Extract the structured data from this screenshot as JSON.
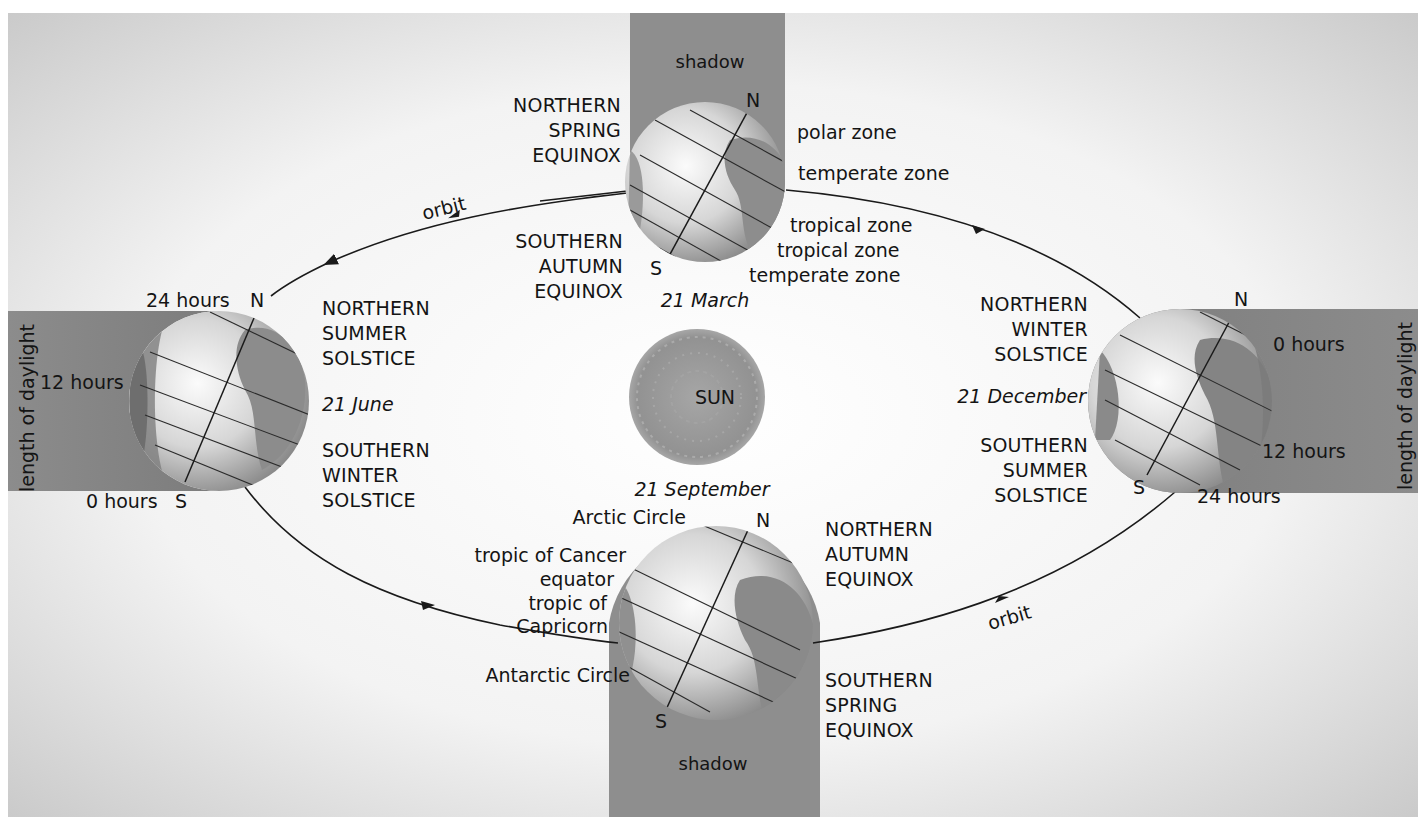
{
  "diagram": {
    "colors": {
      "background_light": "#f4f4f4",
      "background_dark": "#b8b8b8",
      "shadow_band": "#8f8f8f",
      "sun": "#9a9a9a",
      "globe_light": "#f2f2f2",
      "globe_dark": "#7a7a7a",
      "line": "#1a1a1a"
    },
    "sun": {
      "label": "SUN"
    },
    "orbit_labels": [
      "orbit",
      "orbit"
    ],
    "dates": {
      "march": "21 March",
      "june": "21 June",
      "september": "21 September",
      "december": "21 December"
    },
    "seasons": {
      "top_north": [
        "NORTHERN",
        "SPRING",
        "EQUINOX"
      ],
      "top_south": [
        "SOUTHERN",
        "AUTUMN",
        "EQUINOX"
      ],
      "left_north": [
        "NORTHERN",
        "SUMMER",
        "SOLSTICE"
      ],
      "left_south": [
        "SOUTHERN",
        "WINTER",
        "SOLSTICE"
      ],
      "right_north": [
        "NORTHERN",
        "WINTER",
        "SOLSTICE"
      ],
      "right_south": [
        "SOUTHERN",
        "SUMMER",
        "SOLSTICE"
      ],
      "bottom_north": [
        "NORTHERN",
        "AUTUMN",
        "EQUINOX"
      ],
      "bottom_south": [
        "SOUTHERN",
        "SPRING",
        "EQUINOX"
      ]
    },
    "shadow_labels": {
      "top": "shadow",
      "bottom": "shadow"
    },
    "zones": {
      "polar": "polar zone",
      "temperate_north": "temperate zone",
      "tropical_north": "tropical zone",
      "tropical_south": "tropical zone",
      "temperate_south": "temperate zone"
    },
    "latitudes": {
      "arctic": "Arctic Circle",
      "cancer": "tropic of Cancer",
      "equator": "equator",
      "capricorn_1": "tropic of",
      "capricorn_2": "Capricorn",
      "antarctic": "Antarctic Circle"
    },
    "daylight": {
      "axis_label": "length of daylight",
      "left": {
        "top": "24 hours",
        "middle": "12 hours",
        "bottom": "0 hours"
      },
      "right": {
        "top": "0 hours",
        "middle": "12 hours",
        "bottom": "24 hours"
      }
    },
    "poles": {
      "north": "N",
      "south": "S"
    }
  }
}
